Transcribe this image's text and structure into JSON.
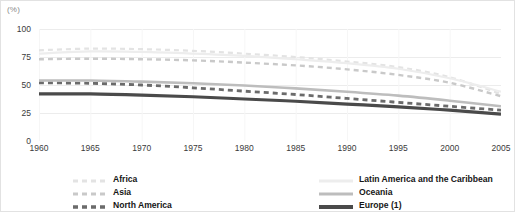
{
  "unit_label": "(%)",
  "legend": {
    "left_column": [
      {
        "name": "Africa",
        "color": "#e3e3e3",
        "style": "dashed",
        "width": 2.2
      },
      {
        "name": "Asia",
        "color": "#c9c9c9",
        "style": "dashed",
        "width": 2.4
      },
      {
        "name": "North America",
        "color": "#6b6b6b",
        "style": "dashed",
        "width": 2.8
      }
    ],
    "right_column": [
      {
        "name": "Latin America and the Caribbean",
        "color": "#ededed",
        "style": "solid",
        "width": 2.2
      },
      {
        "name": "Oceania",
        "color": "#bdbdbd",
        "style": "solid",
        "width": 2.6
      },
      {
        "name": "Europe (1)",
        "color": "#4a4a4a",
        "style": "solid",
        "width": 3.2
      }
    ]
  },
  "chart_data": {
    "type": "line",
    "title": "",
    "subtitle": "",
    "xlabel": "",
    "ylabel": "(%)",
    "xlim": [
      1960,
      2005
    ],
    "ylim": [
      0,
      100
    ],
    "yticks": [
      0,
      25,
      50,
      75,
      100
    ],
    "ytick_labels": [
      "0",
      "25",
      "50",
      "75",
      "100"
    ],
    "x": [
      1960,
      1965,
      1970,
      1975,
      1980,
      1985,
      1990,
      1995,
      2000,
      2005
    ],
    "xtick_labels": [
      "1960",
      "1965",
      "1970",
      "1975",
      "1980",
      "1985",
      "1990",
      "1995",
      "2000",
      "2005"
    ],
    "grid": "horizontal",
    "legend_position": "bottom",
    "series": [
      {
        "name": "Africa",
        "color": "#e3e3e3",
        "style": "dashed",
        "width": 2.2,
        "values": [
          81,
          82.5,
          82,
          80.5,
          78,
          75,
          71,
          66,
          57,
          42
        ]
      },
      {
        "name": "Asia",
        "color": "#c9c9c9",
        "style": "dashed",
        "width": 2.4,
        "values": [
          73,
          73.5,
          73,
          72,
          70,
          67.5,
          64,
          59,
          52,
          40
        ]
      },
      {
        "name": "North America",
        "color": "#6b6b6b",
        "style": "dashed",
        "width": 2.8,
        "values": [
          52,
          51.5,
          50,
          47.5,
          44.5,
          41.5,
          38,
          34.5,
          31,
          27.5
        ]
      },
      {
        "name": "Latin America and the Caribbean",
        "color": "#ededed",
        "style": "solid",
        "width": 2.2,
        "values": [
          78,
          80,
          79.5,
          78,
          76,
          73,
          69.5,
          64.5,
          56,
          44
        ]
      },
      {
        "name": "Oceania",
        "color": "#bdbdbd",
        "style": "solid",
        "width": 2.6,
        "values": [
          54,
          54,
          53,
          51.5,
          49.5,
          47,
          44,
          40.5,
          36,
          31
        ]
      },
      {
        "name": "Europe (1)",
        "color": "#4a4a4a",
        "style": "solid",
        "width": 3.2,
        "values": [
          42,
          42,
          41,
          39.5,
          37.5,
          35.5,
          33,
          30.5,
          27.5,
          24
        ]
      }
    ]
  }
}
